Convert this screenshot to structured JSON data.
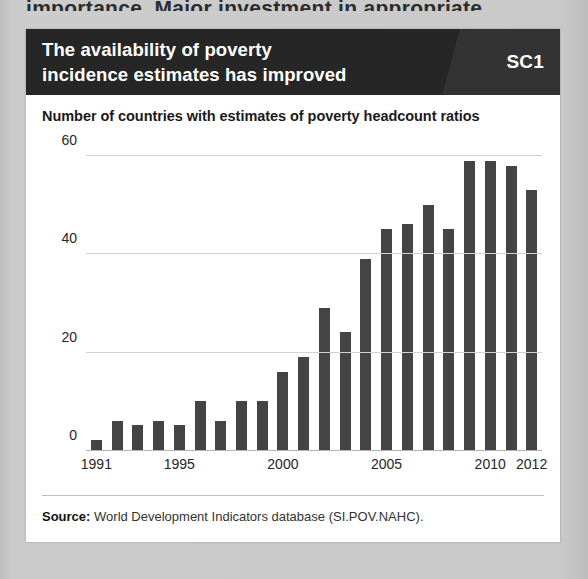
{
  "page": {
    "cutoff_text": "importance. Major investment in appropriate"
  },
  "figure": {
    "title_line1": "The availability of poverty",
    "title_line2": "incidence estimates has improved",
    "badge": "SC1",
    "subtitle": "Number of countries with estimates of poverty headcount ratios",
    "source_label": "Source:",
    "source_text": "World Development Indicators database (SI.POV.NAHC)."
  },
  "colors": {
    "header_bg": "#262626",
    "header_bg_accent": "#333333",
    "bar": "#444444",
    "card_bg": "#ffffff",
    "page_bg": "#c8c8c8",
    "gridline": "#d2d2d2"
  },
  "chart_data": {
    "type": "bar",
    "title": "Number of countries with estimates of poverty headcount ratios",
    "xlabel": "",
    "ylabel": "",
    "ylim": [
      0,
      62
    ],
    "yticks": [
      0,
      20,
      40,
      60
    ],
    "grid": true,
    "legend": "none",
    "categories": [
      "1991",
      "1992",
      "1993",
      "1994",
      "1995",
      "1996",
      "1997",
      "1998",
      "1999",
      "2000",
      "2001",
      "2002",
      "2003",
      "2004",
      "2005",
      "2006",
      "2007",
      "2008",
      "2009",
      "2010",
      "2011",
      "2012"
    ],
    "xtick_labels": [
      "1991",
      "1995",
      "2000",
      "2005",
      "2010",
      "2012"
    ],
    "values": [
      2,
      6,
      5,
      6,
      5,
      10,
      6,
      10,
      10,
      16,
      19,
      29,
      24,
      39,
      45,
      46,
      50,
      45,
      59,
      59,
      58,
      53
    ]
  }
}
